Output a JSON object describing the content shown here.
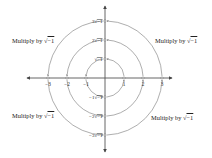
{
  "diagram": {
    "axes": {
      "horizontal": {
        "tick_labels": [
          "-3",
          "-2",
          "-1",
          "1",
          "2",
          "3"
        ]
      },
      "vertical": {
        "tick_labels_positive": [
          "√-1",
          "2√-1",
          "3√-1"
        ],
        "tick_labels_negative": [
          "-1√-1",
          "-2√-1",
          "-3√-1"
        ]
      }
    },
    "tick_labels": {
      "x_neg3": "−3",
      "x_neg2": "−2",
      "x_neg1": "−1",
      "x_1": "1",
      "x_2": "2",
      "x_3": "3",
      "y_1_coef": "",
      "y_2_coef": "2",
      "y_3_coef": "3",
      "y_neg1_coef": "−1",
      "y_neg2_coef": "−2",
      "y_neg3_coef": "−3",
      "radicand": "−1",
      "sqrt_sign": "√"
    },
    "captions": {
      "top_left": {
        "prefix": "Multiply by ",
        "radical": "√",
        "radicand": "−1"
      },
      "top_right": {
        "prefix": "Multiply by ",
        "radical": "√",
        "radicand": "−1"
      },
      "bottom_left": {
        "prefix": "Multiply by ",
        "radical": "√",
        "radicand": "−1"
      },
      "bottom_right": {
        "prefix": "Multiply by ",
        "radical": "√",
        "radicand": "−1"
      }
    },
    "arcs": [
      {
        "quadrant": "top-right",
        "from": "1, 2, 3",
        "to": "√-1, 2√-1, 3√-1"
      },
      {
        "quadrant": "top-left",
        "from": "√-1, 2√-1, 3√-1",
        "to": "-1, -2, -3"
      },
      {
        "quadrant": "bottom-left",
        "from": "-1, -2, -3",
        "to": "-1√-1, -2√-1, -3√-1"
      },
      {
        "quadrant": "bottom-right",
        "from": "-1√-1, -2√-1, -3√-1",
        "to": "1, 2, 3"
      }
    ],
    "colors": {
      "line": "#555555",
      "text": "#222222",
      "background": "#ffffff"
    }
  }
}
